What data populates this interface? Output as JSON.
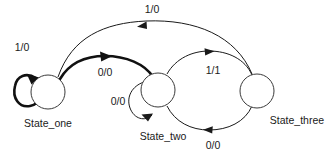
{
  "diagram": {
    "type": "state-machine",
    "title": "",
    "states": [
      {
        "id": "state_one",
        "label": "State_one",
        "cx": 48,
        "cy": 92,
        "r": 17
      },
      {
        "id": "state_two",
        "label": "State_two",
        "cx": 158,
        "cy": 90,
        "r": 17
      },
      {
        "id": "state_three",
        "label": "State_three",
        "cx": 257,
        "cy": 91,
        "r": 17
      }
    ],
    "transitions": [
      {
        "id": "t1",
        "from": "state_one",
        "to": "state_one",
        "label": "1/0",
        "kind": "self-loop",
        "emphasis": "bold"
      },
      {
        "id": "t2",
        "from": "state_one",
        "to": "state_two",
        "label": "0/0",
        "kind": "arc",
        "emphasis": "bold"
      },
      {
        "id": "t3",
        "from": "state_two",
        "to": "state_two",
        "label": "0/0",
        "kind": "self-loop",
        "emphasis": "normal"
      },
      {
        "id": "t4",
        "from": "state_two",
        "to": "state_three",
        "label": "1/1",
        "kind": "arc",
        "emphasis": "normal"
      },
      {
        "id": "t5",
        "from": "state_three",
        "to": "state_two",
        "label": "0/0",
        "kind": "arc",
        "emphasis": "normal"
      },
      {
        "id": "t6",
        "from": "state_three",
        "to": "state_one",
        "label": "1/0",
        "kind": "arc",
        "emphasis": "normal"
      }
    ],
    "labels": {
      "state_one": "State_one",
      "state_two": "State_two",
      "state_three": "State_three",
      "t1": "1/0",
      "t2": "0/0",
      "t3": "0/0",
      "t4": "1/1",
      "t5": "0/0",
      "t6": "1/0"
    },
    "colors": {
      "background": "#ffffff",
      "stroke": "#1a1a1a",
      "state_stroke": "#3a3a3a",
      "text": "#1a1a1a"
    }
  }
}
